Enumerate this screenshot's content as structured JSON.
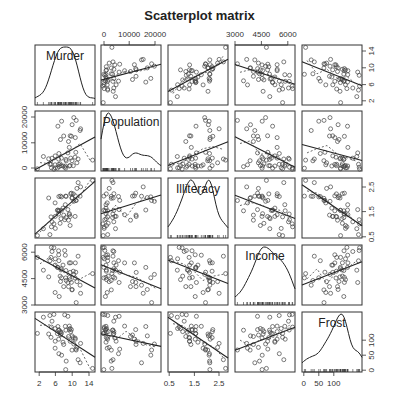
{
  "chart_data": {
    "type": "scatter",
    "title": "Scatterplot matrix",
    "variables": [
      "Murder",
      "Population",
      "Illiteracy",
      "Income",
      "Frost"
    ],
    "diagonal": "density",
    "fit_line": "linear (solid) + lowess smoother (dashed)",
    "axes": {
      "Murder": {
        "range": [
          1,
          15.5
        ],
        "ticks": [
          2,
          6,
          10,
          14
        ],
        "tick_side_x": "bottom",
        "tick_side_y": "right"
      },
      "Population": {
        "range": [
          -1000,
          22000
        ],
        "ticks": [
          0,
          10000,
          20000
        ],
        "tick_side_x": "top",
        "tick_side_y": "left"
      },
      "Illiteracy": {
        "range": [
          0.45,
          2.85
        ],
        "ticks": [
          0.5,
          1.5,
          2.5
        ],
        "tick_side_x": "bottom",
        "tick_side_y": "right"
      },
      "Income": {
        "range": [
          3000,
          6400
        ],
        "ticks": [
          3000,
          4500,
          6000
        ],
        "tick_side_x": "top",
        "tick_side_y": "left"
      },
      "Frost": {
        "range": [
          -5,
          195
        ],
        "ticks": [
          0,
          50,
          100
        ],
        "tick_side_x": "bottom",
        "tick_side_y": "right"
      }
    },
    "grid": false,
    "legend": "none",
    "correlations_approx": {
      "Murder-Population": 0.34,
      "Murder-Illiteracy": 0.7,
      "Murder-Income": -0.23,
      "Murder-Frost": -0.54,
      "Population-Illiteracy": 0.11,
      "Population-Income": 0.21,
      "Population-Frost": -0.33,
      "Illiteracy-Income": -0.44,
      "Illiteracy-Frost": -0.67,
      "Income-Frost": 0.23
    }
  },
  "labels": {
    "title": "Scatterplot matrix",
    "diag": [
      "Murder",
      "Population",
      "Illiteracy",
      "Income",
      "Frost"
    ],
    "top_ticks_pop": [
      "0",
      "10000",
      "20000"
    ],
    "top_ticks_inc": [
      "3000",
      "4500",
      "6000"
    ],
    "bottom_ticks_murder": [
      "2",
      "6",
      "10",
      "14"
    ],
    "bottom_ticks_illit": [
      "0.5",
      "1.5",
      "2.5"
    ],
    "bottom_ticks_frost": [
      "0",
      "50",
      "100"
    ],
    "left_ticks_pop": [
      "0",
      "10000",
      "20000"
    ],
    "left_ticks_inc": [
      "3000",
      "4500",
      "6000"
    ],
    "right_ticks_murder": [
      "2",
      "6",
      "10",
      "14"
    ],
    "right_ticks_illit": [
      "0.5",
      "1.5",
      "2.5"
    ],
    "right_ticks_frost": [
      "0",
      "50",
      "100"
    ]
  }
}
